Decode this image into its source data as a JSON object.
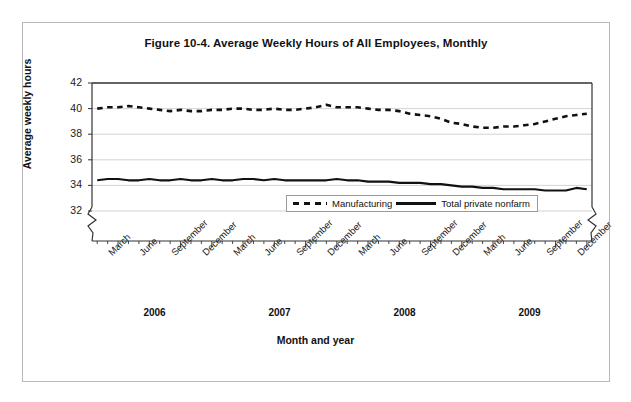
{
  "figure": {
    "title": "Figure 10-4. Average Weekly Hours of All Employees, Monthly",
    "xlabel": "Month and year",
    "ylabel": "Average weekly hours"
  },
  "legend": {
    "items": [
      {
        "label": "Manufacturing",
        "style": "dashed"
      },
      {
        "label": "Total private nonfarm",
        "style": "solid"
      }
    ]
  },
  "axis": {
    "y_ticks": [
      "42",
      "40",
      "38",
      "36",
      "34",
      "32"
    ],
    "x_quarter_labels": [
      "March",
      "June",
      "September",
      "December",
      "March",
      "June",
      "September",
      "December",
      "March",
      "June",
      "September",
      "December",
      "March",
      "June",
      "September",
      "December"
    ],
    "years": [
      "2006",
      "2007",
      "2008",
      "2009"
    ]
  },
  "chart_data": {
    "type": "line",
    "title": "Figure 10-4. Average Weekly Hours of All Employees, Monthly",
    "xlabel": "Month and year",
    "ylabel": "Average weekly hours",
    "ylim": [
      32,
      42
    ],
    "yticks": [
      32,
      34,
      36,
      38,
      40,
      42
    ],
    "grid": true,
    "axis_break_y": true,
    "axis_break_x_right": true,
    "legend_position": "inside-bottom-center",
    "x": [
      "2006-01",
      "2006-02",
      "2006-03",
      "2006-04",
      "2006-05",
      "2006-06",
      "2006-07",
      "2006-08",
      "2006-09",
      "2006-10",
      "2006-11",
      "2006-12",
      "2007-01",
      "2007-02",
      "2007-03",
      "2007-04",
      "2007-05",
      "2007-06",
      "2007-07",
      "2007-08",
      "2007-09",
      "2007-10",
      "2007-11",
      "2007-12",
      "2008-01",
      "2008-02",
      "2008-03",
      "2008-04",
      "2008-05",
      "2008-06",
      "2008-07",
      "2008-08",
      "2008-09",
      "2008-10",
      "2008-11",
      "2008-12",
      "2009-01",
      "2009-02",
      "2009-03",
      "2009-04",
      "2009-05",
      "2009-06",
      "2009-07",
      "2009-08",
      "2009-09",
      "2009-10",
      "2009-11",
      "2009-12"
    ],
    "series": [
      {
        "name": "Manufacturing",
        "style": "dashed",
        "color": "#111111",
        "values": [
          40.0,
          40.1,
          40.1,
          40.2,
          40.1,
          40.0,
          39.9,
          39.8,
          39.9,
          39.8,
          39.8,
          39.9,
          39.9,
          40.0,
          40.0,
          39.9,
          39.9,
          40.0,
          39.9,
          39.9,
          40.0,
          40.1,
          40.3,
          40.1,
          40.1,
          40.1,
          40.0,
          39.9,
          39.9,
          39.8,
          39.6,
          39.5,
          39.4,
          39.2,
          38.9,
          38.8,
          38.6,
          38.5,
          38.5,
          38.6,
          38.6,
          38.7,
          38.8,
          39.0,
          39.2,
          39.4,
          39.5,
          39.6
        ]
      },
      {
        "name": "Total private nonfarm",
        "style": "solid",
        "color": "#111111",
        "values": [
          34.4,
          34.5,
          34.5,
          34.4,
          34.4,
          34.5,
          34.4,
          34.4,
          34.5,
          34.4,
          34.4,
          34.5,
          34.4,
          34.4,
          34.5,
          34.5,
          34.4,
          34.5,
          34.4,
          34.4,
          34.4,
          34.4,
          34.4,
          34.5,
          34.4,
          34.4,
          34.3,
          34.3,
          34.3,
          34.2,
          34.2,
          34.2,
          34.1,
          34.1,
          34.0,
          33.9,
          33.9,
          33.8,
          33.8,
          33.7,
          33.7,
          33.7,
          33.7,
          33.6,
          33.6,
          33.6,
          33.8,
          33.7
        ]
      }
    ]
  }
}
